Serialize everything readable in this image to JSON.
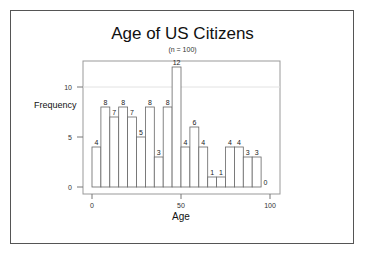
{
  "chart_data": {
    "type": "bar",
    "subtype": "histogram",
    "title": "Age of US Citizens",
    "subtitle": "(n = 100)",
    "xlabel": "Age",
    "ylabel": "Frequency",
    "bin_width": 5,
    "bin_edges": [
      0,
      5,
      10,
      15,
      20,
      25,
      30,
      35,
      40,
      45,
      50,
      55,
      60,
      65,
      70,
      75,
      80,
      85,
      90,
      95,
      100
    ],
    "categories": [
      "0-5",
      "5-10",
      "10-15",
      "15-20",
      "20-25",
      "25-30",
      "30-35",
      "35-40",
      "40-45",
      "45-50",
      "50-55",
      "55-60",
      "60-65",
      "65-70",
      "70-75",
      "75-80",
      "80-85",
      "85-90",
      "90-95",
      "95-100"
    ],
    "values": [
      4,
      8,
      7,
      8,
      7,
      5,
      8,
      3,
      8,
      12,
      4,
      6,
      4,
      1,
      1,
      4,
      4,
      3,
      3,
      0
    ],
    "xlim": [
      0,
      100
    ],
    "ylim": [
      0,
      12
    ],
    "x_ticks": [
      0,
      50,
      100
    ],
    "y_ticks": [
      0,
      5,
      10
    ],
    "grid": "horizontal line at 10 (light)",
    "legend": "none",
    "data_labels": true,
    "colors": {
      "bar_fill": "#ffffff",
      "bar_stroke": "#666666",
      "frame": "#555555"
    }
  },
  "header": {
    "title": "Age of US Citizens",
    "subtitle": "(n = 100)"
  },
  "axes": {
    "xlabel": "Age",
    "ylabel": "Frequency",
    "x_tick_labels": [
      "0",
      "50",
      "100"
    ],
    "y_tick_labels": [
      "0",
      "5",
      "10"
    ]
  }
}
